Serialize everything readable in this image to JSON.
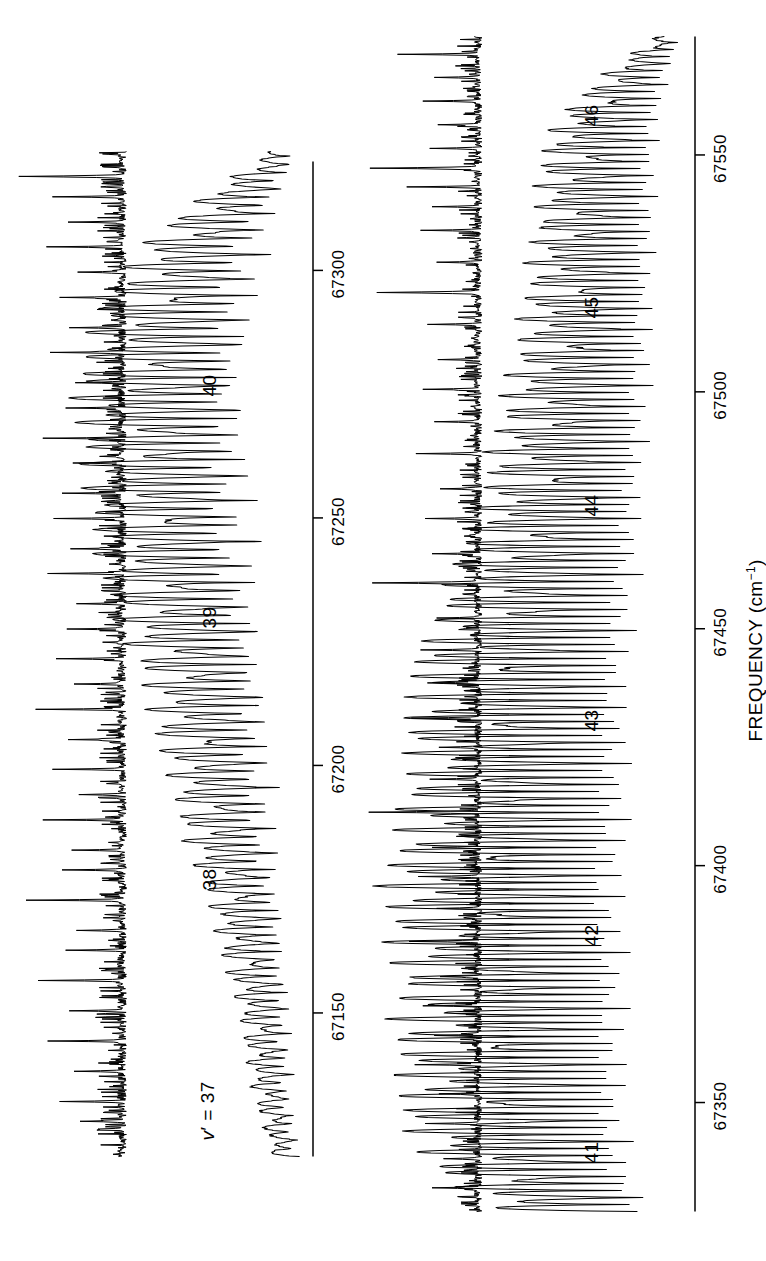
{
  "figure": {
    "kind": "spectrum",
    "orientation": "rotated-90-ccw",
    "background_color": "#ffffff",
    "trace_color": "#000000"
  },
  "axis": {
    "title_main": "FREQUENCY (cm",
    "title_sup": "−1",
    "title_close": ")",
    "title_full": "FREQUENCY (cm−1)",
    "units": "cm−1"
  },
  "panels": [
    {
      "id": "upper",
      "name": "upper-panel",
      "axis_ticks": [
        "67150",
        "67200",
        "67250",
        "67300"
      ],
      "axis_tick_values": [
        67150,
        67200,
        67250,
        67300
      ],
      "axis_range": [
        67120,
        67325
      ],
      "vibrational_labels": [
        {
          "text": "v′ = 37",
          "value": 37,
          "italic_v": true
        },
        {
          "text": "38",
          "value": 38
        },
        {
          "text": "39",
          "value": 39
        },
        {
          "text": "40",
          "value": 40
        }
      ]
    },
    {
      "id": "lower",
      "name": "lower-panel",
      "axis_ticks": [
        "67350",
        "67400",
        "67450",
        "67500",
        "67550"
      ],
      "axis_tick_values": [
        67350,
        67400,
        67450,
        67500,
        67550
      ],
      "axis_range": [
        67325,
        67575
      ],
      "vibrational_labels": [
        {
          "text": "41",
          "value": 41
        },
        {
          "text": "42",
          "value": 42
        },
        {
          "text": "43",
          "value": 43
        },
        {
          "text": "44",
          "value": 44
        },
        {
          "text": "45",
          "value": 45
        },
        {
          "text": "46",
          "value": 46
        }
      ]
    }
  ],
  "chart_data": {
    "type": "line",
    "title": "",
    "xlabel": "FREQUENCY (cm−1)",
    "ylabel": "",
    "grid": false,
    "legend": null,
    "xlim": [
      67120,
      67575
    ],
    "annotations": [
      {
        "label": "v′ = 37",
        "x": 67135,
        "panel": "upper"
      },
      {
        "label": "38",
        "x": 67190,
        "panel": "upper"
      },
      {
        "label": "39",
        "x": 67243,
        "panel": "upper"
      },
      {
        "label": "40",
        "x": 67291,
        "panel": "upper"
      },
      {
        "label": "41",
        "x": 67337,
        "panel": "lower"
      },
      {
        "label": "42",
        "x": 67383,
        "panel": "lower"
      },
      {
        "label": "43",
        "x": 67428,
        "panel": "lower"
      },
      {
        "label": "44",
        "x": 67474,
        "panel": "lower"
      },
      {
        "label": "45",
        "x": 67516,
        "panel": "lower"
      },
      {
        "label": "46",
        "x": 67557,
        "panel": "lower"
      }
    ],
    "series": [
      {
        "name": "upper-reference-marker-trace",
        "panel": "upper",
        "style": "sharp-line-markers",
        "xlim": [
          67120,
          67325
        ],
        "description": "Sharp etalon/atomic frequency marker lines on a noisy baseline"
      },
      {
        "name": "upper-lif-excitation-trace",
        "panel": "upper",
        "style": "rotationally-resolved-band",
        "xlim": [
          67120,
          67325
        ],
        "description": "Rotationally resolved LIF excitation bands for v' = 37-40"
      },
      {
        "name": "lower-reference-marker-trace",
        "panel": "lower",
        "style": "sharp-line-markers",
        "xlim": [
          67325,
          67575
        ],
        "description": "Sharp etalon/atomic frequency marker lines on a noisy baseline"
      },
      {
        "name": "lower-lif-excitation-trace",
        "panel": "lower",
        "style": "rotationally-resolved-band",
        "xlim": [
          67325,
          67575
        ],
        "description": "Rotationally resolved LIF excitation bands for v' = 41-46"
      }
    ]
  }
}
